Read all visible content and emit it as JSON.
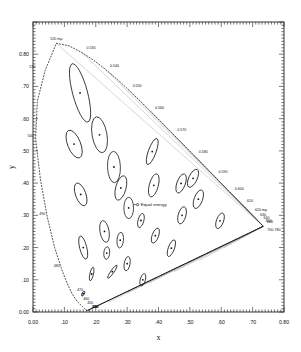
{
  "figure": {
    "type": "scatter",
    "title": "",
    "xlabel": "x",
    "ylabel": "y",
    "equal_energy_label": "Equal energy",
    "frame": {
      "left": 0.0,
      "right": 0.8,
      "bottom": 0.0,
      "top": 0.9
    },
    "grid": false,
    "legend": false
  },
  "axes": {
    "x": {
      "label": "x",
      "ticks": [
        "0.00",
        ".10",
        ".20",
        ".30",
        ".40",
        ".50",
        ".60",
        ".70",
        "0.80"
      ],
      "tickvals": [
        0.0,
        0.1,
        0.2,
        0.3,
        0.4,
        0.5,
        0.6,
        0.7,
        0.8
      ],
      "range": [
        0.0,
        0.8
      ]
    },
    "y": {
      "label": "y",
      "ticks": [
        "0.00",
        ".10",
        ".20",
        ".30",
        ".40",
        ".50",
        ".60",
        ".70",
        "0.80"
      ],
      "tickvals": [
        0.0,
        0.1,
        0.2,
        0.3,
        0.4,
        0.5,
        0.6,
        0.7,
        0.8
      ],
      "range": [
        0.0,
        0.9
      ]
    }
  },
  "chart_data": {
    "type": "scatter",
    "title": "",
    "xlabel": "x",
    "ylabel": "y",
    "xlim": [
      0.0,
      0.8
    ],
    "ylim": [
      0.0,
      0.9
    ],
    "grid": false,
    "legend_position": "none",
    "spectral_locus": [
      [
        0.1741,
        0.005
      ],
      [
        0.174,
        0.005
      ],
      [
        0.1738,
        0.0049
      ],
      [
        0.1736,
        0.0049
      ],
      [
        0.1733,
        0.0048
      ],
      [
        0.173,
        0.0048
      ],
      [
        0.1726,
        0.0048
      ],
      [
        0.1721,
        0.0048
      ],
      [
        0.1714,
        0.0051
      ],
      [
        0.1703,
        0.0058
      ],
      [
        0.1689,
        0.0069
      ],
      [
        0.1669,
        0.0086
      ],
      [
        0.1644,
        0.0109
      ],
      [
        0.1611,
        0.0138
      ],
      [
        0.1566,
        0.0177
      ],
      [
        0.151,
        0.0227
      ],
      [
        0.144,
        0.0297
      ],
      [
        0.1355,
        0.0399
      ],
      [
        0.1241,
        0.0578
      ],
      [
        0.1096,
        0.0868
      ],
      [
        0.0913,
        0.1327
      ],
      [
        0.0687,
        0.2007
      ],
      [
        0.0454,
        0.295
      ],
      [
        0.0235,
        0.4127
      ],
      [
        0.0082,
        0.5384
      ],
      [
        0.0139,
        0.6548
      ],
      [
        0.0389,
        0.7502
      ],
      [
        0.0743,
        0.8338
      ],
      [
        0.1142,
        0.8262
      ],
      [
        0.1547,
        0.8059
      ],
      [
        0.1929,
        0.7816
      ],
      [
        0.2296,
        0.7543
      ],
      [
        0.2658,
        0.7243
      ],
      [
        0.3016,
        0.6923
      ],
      [
        0.3373,
        0.6589
      ],
      [
        0.3731,
        0.6245
      ],
      [
        0.4087,
        0.5896
      ],
      [
        0.4441,
        0.5547
      ],
      [
        0.4788,
        0.5202
      ],
      [
        0.5125,
        0.4866
      ],
      [
        0.5448,
        0.4544
      ],
      [
        0.5752,
        0.4242
      ],
      [
        0.6029,
        0.3965
      ],
      [
        0.627,
        0.3725
      ],
      [
        0.6482,
        0.3514
      ],
      [
        0.6658,
        0.334
      ],
      [
        0.6801,
        0.3197
      ],
      [
        0.6915,
        0.3083
      ],
      [
        0.7006,
        0.2993
      ],
      [
        0.7079,
        0.292
      ],
      [
        0.714,
        0.2859
      ],
      [
        0.719,
        0.2809
      ],
      [
        0.723,
        0.277
      ],
      [
        0.726,
        0.274
      ],
      [
        0.7283,
        0.2717
      ],
      [
        0.73,
        0.27
      ],
      [
        0.7311,
        0.2689
      ],
      [
        0.732,
        0.268
      ],
      [
        0.7327,
        0.2673
      ],
      [
        0.7334,
        0.2666
      ],
      [
        0.734,
        0.266
      ]
    ],
    "wavelength_markers": [
      {
        "label": "380",
        "x": 0.1741,
        "y": 0.005
      },
      {
        "label": "400",
        "x": 0.1733,
        "y": 0.0048
      },
      {
        "label": "420",
        "x": 0.1714,
        "y": 0.0051
      },
      {
        "label": "450",
        "x": 0.1566,
        "y": 0.0177
      },
      {
        "label": "460",
        "x": 0.144,
        "y": 0.0297
      },
      {
        "label": "470",
        "x": 0.1241,
        "y": 0.0578
      },
      {
        "label": "480",
        "x": 0.0913,
        "y": 0.1327
      },
      {
        "label": "490",
        "x": 0.0454,
        "y": 0.295
      },
      {
        "label": "500",
        "x": 0.0082,
        "y": 0.5384
      },
      {
        "label": "510",
        "x": 0.0139,
        "y": 0.7502
      },
      {
        "label": "520 mμ",
        "x": 0.0743,
        "y": 0.8338
      },
      {
        "label": "0.530",
        "x": 0.1547,
        "y": 0.8059
      },
      {
        "label": "0.540",
        "x": 0.2296,
        "y": 0.7543
      },
      {
        "label": "0.550",
        "x": 0.3016,
        "y": 0.6923
      },
      {
        "label": "0.560",
        "x": 0.3731,
        "y": 0.6245
      },
      {
        "label": "0.570",
        "x": 0.4441,
        "y": 0.5547
      },
      {
        "label": "0.580",
        "x": 0.5125,
        "y": 0.4866
      },
      {
        "label": "0.590",
        "x": 0.5752,
        "y": 0.4242
      },
      {
        "label": "0.600",
        "x": 0.627,
        "y": 0.3725
      },
      {
        "label": "610",
        "x": 0.6658,
        "y": 0.334
      },
      {
        "label": "620 mμ",
        "x": 0.6915,
        "y": 0.3083
      },
      {
        "label": "630",
        "x": 0.7079,
        "y": 0.292
      },
      {
        "label": "640",
        "x": 0.719,
        "y": 0.2809
      },
      {
        "label": "650",
        "x": 0.726,
        "y": 0.274
      },
      {
        "label": "660",
        "x": 0.73,
        "y": 0.27
      },
      {
        "label": "700-780",
        "x": 0.734,
        "y": 0.266
      }
    ],
    "equal_energy_point": {
      "x": 0.3333,
      "y": 0.3333,
      "label": "Equal energy"
    },
    "ellipses": [
      {
        "cx": 0.16,
        "cy": 0.057,
        "a": 0.0085,
        "b": 0.0035,
        "theta": 62
      },
      {
        "cx": 0.187,
        "cy": 0.118,
        "a": 0.022,
        "b": 0.0055,
        "theta": 77
      },
      {
        "cx": 0.253,
        "cy": 0.125,
        "a": 0.025,
        "b": 0.005,
        "theta": 55
      },
      {
        "cx": 0.15,
        "cy": 0.68,
        "a": 0.096,
        "b": 0.023,
        "theta": 105
      },
      {
        "cx": 0.131,
        "cy": 0.521,
        "a": 0.047,
        "b": 0.02,
        "theta": 112
      },
      {
        "cx": 0.212,
        "cy": 0.55,
        "a": 0.058,
        "b": 0.023,
        "theta": 100
      },
      {
        "cx": 0.258,
        "cy": 0.45,
        "a": 0.05,
        "b": 0.02,
        "theta": 92
      },
      {
        "cx": 0.152,
        "cy": 0.365,
        "a": 0.038,
        "b": 0.016,
        "theta": 110
      },
      {
        "cx": 0.28,
        "cy": 0.385,
        "a": 0.04,
        "b": 0.016,
        "theta": 75
      },
      {
        "cx": 0.38,
        "cy": 0.498,
        "a": 0.044,
        "b": 0.012,
        "theta": 70
      },
      {
        "cx": 0.16,
        "cy": 0.2,
        "a": 0.038,
        "b": 0.011,
        "theta": 104
      },
      {
        "cx": 0.228,
        "cy": 0.25,
        "a": 0.035,
        "b": 0.014,
        "theta": 100
      },
      {
        "cx": 0.305,
        "cy": 0.323,
        "a": 0.034,
        "b": 0.015,
        "theta": 90
      },
      {
        "cx": 0.385,
        "cy": 0.393,
        "a": 0.038,
        "b": 0.014,
        "theta": 75
      },
      {
        "cx": 0.472,
        "cy": 0.399,
        "a": 0.032,
        "b": 0.013,
        "theta": 70
      },
      {
        "cx": 0.527,
        "cy": 0.35,
        "a": 0.031,
        "b": 0.013,
        "theta": 70
      },
      {
        "cx": 0.475,
        "cy": 0.3,
        "a": 0.028,
        "b": 0.012,
        "theta": 75
      },
      {
        "cx": 0.51,
        "cy": 0.415,
        "a": 0.031,
        "b": 0.013,
        "theta": 65
      },
      {
        "cx": 0.596,
        "cy": 0.283,
        "a": 0.026,
        "b": 0.011,
        "theta": 70
      },
      {
        "cx": 0.344,
        "cy": 0.284,
        "a": 0.023,
        "b": 0.009,
        "theta": 75
      },
      {
        "cx": 0.39,
        "cy": 0.237,
        "a": 0.025,
        "b": 0.01,
        "theta": 70
      },
      {
        "cx": 0.441,
        "cy": 0.198,
        "a": 0.028,
        "b": 0.0095,
        "theta": 70
      },
      {
        "cx": 0.278,
        "cy": 0.223,
        "a": 0.025,
        "b": 0.01,
        "theta": 85
      },
      {
        "cx": 0.3,
        "cy": 0.15,
        "a": 0.023,
        "b": 0.009,
        "theta": 80
      },
      {
        "cx": 0.35,
        "cy": 0.1,
        "a": 0.02,
        "b": 0.008,
        "theta": 75
      },
      {
        "cx": 0.235,
        "cy": 0.183,
        "a": 0.02,
        "b": 0.009,
        "theta": 85
      }
    ]
  }
}
